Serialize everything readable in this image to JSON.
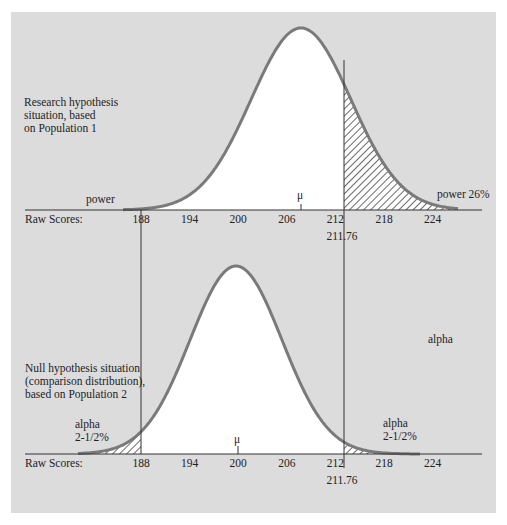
{
  "top": {
    "description": [
      "Research hypothesis",
      "situation, based",
      "on Population 1"
    ],
    "left_tail_label": "power",
    "right_tail_label": "power 26%",
    "mu_label": "μ",
    "axis_label": "Raw Scores:",
    "ticks": [
      "188",
      "194",
      "200",
      "206",
      "212",
      "218",
      "224"
    ],
    "cutoff_label": "211.76"
  },
  "bottom": {
    "description": [
      "Null hypothesis situation",
      "(comparison distribution),",
      "based on Population 2"
    ],
    "left_tail_label": [
      "alpha",
      "2-1/2%"
    ],
    "right_tail_label": [
      "alpha",
      "2-1/2%"
    ],
    "floating_label": "alpha",
    "mu_label": "μ",
    "axis_label": "Raw Scores:",
    "ticks": [
      "188",
      "194",
      "200",
      "206",
      "212",
      "218",
      "224"
    ],
    "cutoff_label": "211.76"
  },
  "colors": {
    "panel": "#dcdcdc",
    "curve": "#7a7a7a",
    "fill": "#ffffff",
    "line": "#333333"
  }
}
